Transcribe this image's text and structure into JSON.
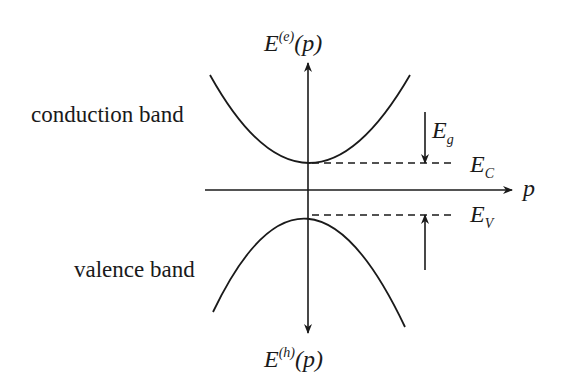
{
  "diagram": {
    "labels": {
      "conduction_band": "conduction band",
      "valence_band": "valence band",
      "energy_electron": {
        "base": "E",
        "sup": "(e)",
        "arg": "(p)"
      },
      "energy_hole": {
        "base": "E",
        "sup": "(h)",
        "arg": "(p)"
      },
      "momentum_axis": "p",
      "band_gap": {
        "base": "E",
        "sub": "g"
      },
      "conduction_edge": {
        "base": "E",
        "sub": "C"
      },
      "valence_edge": {
        "base": "E",
        "sub": "V"
      }
    },
    "elements": [
      "vertical energy axis with arrows up (electron energy) and down (hole energy)",
      "horizontal momentum axis p",
      "upward-opening parabola (conduction band) with minimum at E_C",
      "downward-opening parabola (valence band) with maximum at E_V",
      "dashed lines marking E_C and E_V",
      "arrows indicating band gap E_g between E_C and E_V"
    ],
    "colors": {
      "line": "#1a1a1a",
      "background": "#ffffff"
    }
  }
}
